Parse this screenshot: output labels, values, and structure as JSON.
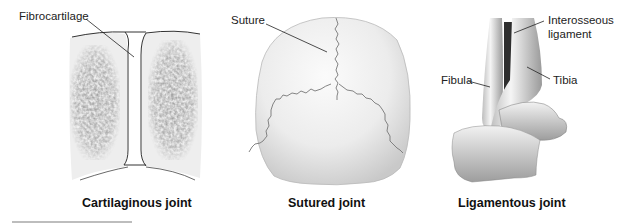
{
  "figure": {
    "panels": [
      {
        "id": "cartilaginous",
        "caption": "Cartilaginous joint",
        "labels": [
          "Fibrocartilage"
        ]
      },
      {
        "id": "sutured",
        "caption": "Sutured joint",
        "labels": [
          "Suture"
        ]
      },
      {
        "id": "ligamentous",
        "caption": "Ligamentous joint",
        "labels": [
          "Interosseous",
          "ligament",
          "Fibula",
          "Tibia"
        ]
      }
    ]
  }
}
